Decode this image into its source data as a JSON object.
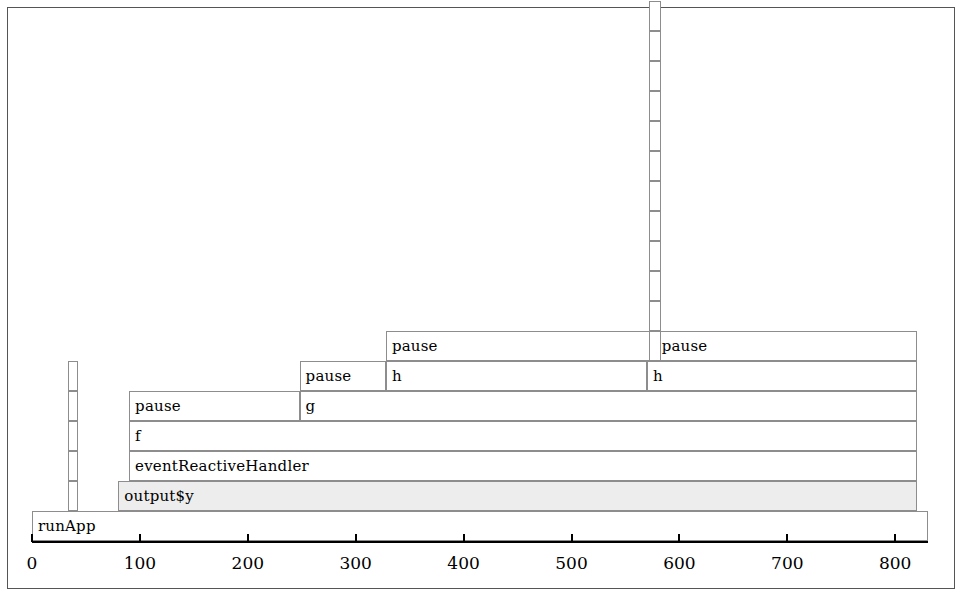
{
  "figure": {
    "type": "flamegraph",
    "frame_color": "#555555",
    "block_border_color": "#8d8d8d",
    "highlight_color": "#ededed",
    "background": "#ffffff"
  },
  "axis": {
    "orientation": "horizontal",
    "min": 0,
    "max": 830,
    "ticks": [
      0,
      100,
      200,
      300,
      400,
      500,
      600,
      700,
      800
    ],
    "tick_labels": [
      "0",
      "100",
      "200",
      "300",
      "400",
      "500",
      "600",
      "700",
      "800"
    ],
    "label": ""
  },
  "chart_data": {
    "type": "bar",
    "title": "",
    "xlabel": "",
    "ylabel": "",
    "xlim": [
      0,
      830
    ],
    "grid": false,
    "legend": null,
    "categories": [
      "runApp",
      "output$y",
      "eventReactiveHandler",
      "f",
      "pause / g / h",
      "pause / h",
      "pause"
    ],
    "depth_levels": 7,
    "blocks": [
      {
        "label": "runApp",
        "depth": 0,
        "start": 0,
        "end": 830,
        "highlight": false
      },
      {
        "label": "output$y",
        "depth": 1,
        "start": 80,
        "end": 820,
        "highlight": true
      },
      {
        "label": "eventReactiveHandler",
        "depth": 2,
        "start": 90,
        "end": 820,
        "highlight": false
      },
      {
        "label": "f",
        "depth": 3,
        "start": 90,
        "end": 820,
        "highlight": false
      },
      {
        "label": "pause",
        "depth": 4,
        "start": 90,
        "end": 248,
        "highlight": false
      },
      {
        "label": "g",
        "depth": 4,
        "start": 248,
        "end": 820,
        "highlight": false
      },
      {
        "label": "pause",
        "depth": 5,
        "start": 248,
        "end": 328,
        "highlight": false
      },
      {
        "label": "h",
        "depth": 5,
        "start": 328,
        "end": 570,
        "highlight": false
      },
      {
        "label": "h",
        "depth": 5,
        "start": 570,
        "end": 820,
        "highlight": false
      },
      {
        "label": "pause",
        "depth": 6,
        "start": 328,
        "end": 578,
        "highlight": false
      },
      {
        "label": "pause",
        "depth": 6,
        "start": 578,
        "end": 820,
        "highlight": false
      }
    ],
    "narrow_stacks": [
      {
        "name": "left-narrow-stack",
        "start": 33,
        "end": 43,
        "base_depth": 1,
        "segments": 5
      },
      {
        "name": "right-narrow-stack",
        "start": 572,
        "end": 583,
        "base_depth": 6,
        "segments": 12
      }
    ]
  }
}
